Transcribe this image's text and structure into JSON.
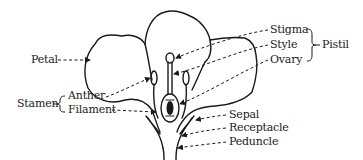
{
  "diagram": {
    "type": "labeled-anatomy",
    "stroke_color": "#1a1a1a",
    "background": "#ffffff"
  },
  "labels": {
    "petal": "Petal",
    "stigma": "Stigma",
    "style": "Style",
    "ovary": "Ovary",
    "pistil": "Pistil",
    "stamen": "Stamen",
    "anther": "Anther",
    "filament": "Filament",
    "sepal": "Sepal",
    "receptacle": "Receptacle",
    "peduncle": "Peduncle"
  },
  "groups": {
    "pistil": [
      "Stigma",
      "Style",
      "Ovary"
    ],
    "stamen": [
      "Anther",
      "Filament"
    ]
  }
}
